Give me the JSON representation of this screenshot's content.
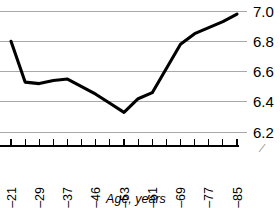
{
  "chart_data": {
    "type": "line",
    "title": "",
    "xlabel": "Age, years",
    "ylabel": "",
    "categories": [
      "18–21",
      "22–25",
      "26–29",
      "30–33",
      "34–37",
      "38–41",
      "42–46",
      "46–49",
      "50–53",
      "54–57",
      "58–61",
      "62–65",
      "66–69",
      "70–73",
      "74–77",
      "78–81",
      "82–85"
    ],
    "tick_labels": [
      "18–21",
      "26–29",
      "34–37",
      "42–46",
      "50–53",
      "58–61",
      "66–69",
      "74–77",
      "82–85"
    ],
    "values": [
      6.8,
      6.53,
      6.52,
      6.54,
      6.55,
      6.5,
      6.45,
      6.39,
      6.33,
      6.42,
      6.46,
      6.62,
      6.78,
      6.85,
      6.89,
      6.93,
      6.98
    ],
    "ylim": [
      6.2,
      7.05
    ],
    "yticks": [
      6.2,
      6.4,
      6.6,
      6.8,
      7.0
    ],
    "ytick_labels": [
      "6.2",
      "6.4",
      "6.6",
      "6.8",
      "7.0"
    ],
    "grid": true,
    "legend": "none",
    "axis_title": "Age, years",
    "artifact_glyph": "⁄"
  },
  "colors": {
    "line": "#000000",
    "grid": "#a8a8a8",
    "axis": "#000000",
    "background": "#ffffff"
  }
}
